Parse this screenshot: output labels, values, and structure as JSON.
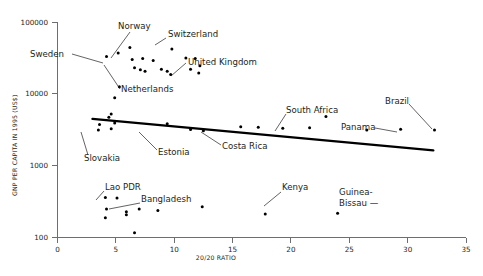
{
  "chart_data": {
    "type": "scatter",
    "title": "",
    "xlabel": "20/20 RATIO",
    "ylabel": "GNP PER CAPITA IN 1995 (US$)",
    "xlim": [
      0,
      35
    ],
    "ylim": [
      100,
      100000
    ],
    "yscale": "log",
    "xscale": "linear",
    "grid": false,
    "legend": false,
    "xticks": [
      0,
      5,
      10,
      15,
      20,
      25,
      30,
      35
    ],
    "xticklabels": [
      "0",
      "5",
      "10",
      "15",
      "20",
      "25",
      "30",
      "35"
    ],
    "yticks": [
      100,
      1000,
      10000,
      100000
    ],
    "yticklabels": [
      "100",
      "1000",
      "10000",
      "100000"
    ],
    "points": [
      {
        "x": 4.2,
        "y": 33000
      },
      {
        "x": 5.2,
        "y": 37000
      },
      {
        "x": 6.2,
        "y": 44000
      },
      {
        "x": 6.4,
        "y": 30000
      },
      {
        "x": 7.3,
        "y": 31000
      },
      {
        "x": 6.6,
        "y": 23000
      },
      {
        "x": 7.1,
        "y": 21500
      },
      {
        "x": 7.5,
        "y": 20500
      },
      {
        "x": 8.2,
        "y": 29000
      },
      {
        "x": 8.9,
        "y": 22000
      },
      {
        "x": 9.4,
        "y": 20500
      },
      {
        "x": 9.8,
        "y": 42000
      },
      {
        "x": 11.0,
        "y": 31500
      },
      {
        "x": 11.8,
        "y": 31000
      },
      {
        "x": 12.2,
        "y": 24500
      },
      {
        "x": 11.4,
        "y": 22000
      },
      {
        "x": 12.1,
        "y": 19500
      },
      {
        "x": 9.7,
        "y": 18500
      },
      {
        "x": 5.3,
        "y": 12500
      },
      {
        "x": 4.9,
        "y": 8800
      },
      {
        "x": 4.6,
        "y": 5200
      },
      {
        "x": 4.4,
        "y": 4700
      },
      {
        "x": 4.9,
        "y": 3900
      },
      {
        "x": 4.6,
        "y": 3250
      },
      {
        "x": 3.6,
        "y": 3700
      },
      {
        "x": 3.5,
        "y": 3100
      },
      {
        "x": 9.4,
        "y": 3800
      },
      {
        "x": 11.4,
        "y": 3150
      },
      {
        "x": 12.5,
        "y": 3050
      },
      {
        "x": 15.7,
        "y": 3450
      },
      {
        "x": 17.2,
        "y": 3400
      },
      {
        "x": 19.3,
        "y": 3300
      },
      {
        "x": 21.6,
        "y": 3350
      },
      {
        "x": 23.0,
        "y": 4800
      },
      {
        "x": 26.5,
        "y": 3100
      },
      {
        "x": 29.4,
        "y": 3200
      },
      {
        "x": 32.3,
        "y": 3100
      },
      {
        "x": 4.1,
        "y": 355
      },
      {
        "x": 5.1,
        "y": 350
      },
      {
        "x": 4.2,
        "y": 245
      },
      {
        "x": 4.1,
        "y": 185
      },
      {
        "x": 5.9,
        "y": 225
      },
      {
        "x": 5.9,
        "y": 205
      },
      {
        "x": 6.6,
        "y": 115
      },
      {
        "x": 7.0,
        "y": 245
      },
      {
        "x": 8.6,
        "y": 235
      },
      {
        "x": 12.4,
        "y": 265
      },
      {
        "x": 17.8,
        "y": 210
      },
      {
        "x": 24.0,
        "y": 215
      }
    ],
    "trendline": {
      "x": [
        3.0,
        32.2
      ],
      "y": [
        4450,
        1620
      ]
    },
    "annotations": [
      {
        "label": "Norway",
        "text_x": 118,
        "text_y": 29,
        "anchor": "start",
        "leader": [
          [
            130,
            32
          ],
          [
            111,
            58
          ]
        ]
      },
      {
        "label": "Switzerland",
        "text_x": 168,
        "text_y": 37,
        "anchor": "start",
        "leader": [
          [
            166,
            38
          ],
          [
            155,
            45
          ]
        ]
      },
      {
        "label": "Sweden",
        "text_x": 30,
        "text_y": 57,
        "anchor": "start",
        "leader": [
          [
            72,
            54
          ],
          [
            103,
            63
          ]
        ]
      },
      {
        "label": "United Kingdom",
        "text_x": 188,
        "text_y": 65,
        "anchor": "start",
        "leader": [
          [
            186,
            63
          ],
          [
            171,
            76
          ]
        ]
      },
      {
        "label": "Netherlands",
        "text_x": 121,
        "text_y": 92,
        "anchor": "start",
        "leader": [
          [
            120,
            89
          ],
          [
            104,
            65
          ]
        ]
      },
      {
        "label": "Slovakia",
        "text_x": 84,
        "text_y": 161,
        "anchor": "start",
        "leader": [
          [
            88,
            155
          ],
          [
            81,
            132
          ]
        ]
      },
      {
        "label": "Estonia",
        "text_x": 158,
        "text_y": 155,
        "anchor": "start",
        "leader": [
          [
            157,
            150
          ],
          [
            139,
            132
          ]
        ]
      },
      {
        "label": "Costa Rica",
        "text_x": 222,
        "text_y": 149,
        "anchor": "start",
        "leader": [
          [
            221,
            145
          ],
          [
            201,
            132
          ]
        ]
      },
      {
        "label": "South Africa",
        "text_x": 286,
        "text_y": 113,
        "anchor": "start",
        "leader": [
          [
            286,
            114
          ],
          [
            275,
            131
          ]
        ]
      },
      {
        "label": "Brazil",
        "text_x": 385,
        "text_y": 104,
        "anchor": "start",
        "leader": [
          [
            409,
            104
          ],
          [
            432,
            129
          ]
        ]
      },
      {
        "label": "Panama",
        "text_x": 341,
        "text_y": 130,
        "anchor": "start",
        "leader": [
          [
            375,
            128
          ],
          [
            397,
            132
          ]
        ]
      },
      {
        "label": "Lao PDR",
        "text_x": 105,
        "text_y": 190,
        "anchor": "start",
        "leader": [
          [
            104,
            191
          ],
          [
            96,
            200
          ]
        ]
      },
      {
        "label": "Bangladesh",
        "text_x": 141,
        "text_y": 202,
        "anchor": "start",
        "leader": [
          [
            140,
            203
          ],
          [
            109,
            209
          ]
        ]
      },
      {
        "label": "Kenya",
        "text_x": 282,
        "text_y": 190,
        "anchor": "start",
        "leader": [
          [
            281,
            192
          ],
          [
            264,
            206
          ]
        ]
      },
      {
        "label": "Guinea-",
        "text_x": 339,
        "text_y": 195,
        "anchor": "start",
        "leader": null
      },
      {
        "label": "Bissau —",
        "text_x": 339,
        "text_y": 206,
        "anchor": "start",
        "leader": null
      }
    ]
  },
  "colors": {
    "point": "#000000",
    "trendline": "#000000",
    "axis": "#6d6e71",
    "text": "#231f20",
    "background": "#ffffff"
  }
}
